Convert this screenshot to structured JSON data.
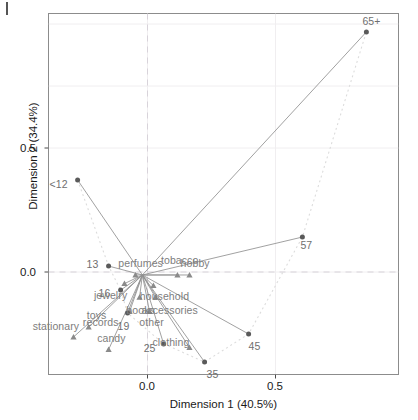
{
  "chart_data": {
    "type": "scatter",
    "title": "",
    "subtitle": "",
    "xlabel": "Dimension 1 (40.5%)",
    "ylabel": "Dimension 2 (34.4%)",
    "xlim": [
      -0.385,
      0.985
    ],
    "ylim": [
      -0.415,
      1.045
    ],
    "xticks": [
      0.0,
      0.5
    ],
    "xtick_labels": [
      "0.0",
      "0.5"
    ],
    "yticks": [
      0.0,
      0.5
    ],
    "ytick_labels": [
      "0.0",
      "0.5"
    ],
    "grid": "faint major + minor gridlines, dashed reference lines at x=0 and y=0",
    "legend": "none",
    "series": [
      {
        "name": "age-groups",
        "marker": "circle",
        "color": "#5a5a5a",
        "points": [
          {
            "label": "65+",
            "x": 0.855,
            "y": 0.968
          },
          {
            "label": "57",
            "x": 0.605,
            "y": 0.141
          },
          {
            "label": "<12",
            "x": -0.273,
            "y": 0.371
          },
          {
            "label": "13",
            "x": -0.152,
            "y": 0.024
          },
          {
            "label": "16",
            "x": -0.105,
            "y": -0.073
          },
          {
            "label": "19",
            "x": -0.078,
            "y": -0.165
          },
          {
            "label": "25",
            "x": 0.063,
            "y": -0.29
          },
          {
            "label": "35",
            "x": 0.223,
            "y": -0.363
          },
          {
            "label": "45",
            "x": 0.395,
            "y": -0.25
          }
        ]
      },
      {
        "name": "product-categories",
        "marker": "triangle",
        "color": "#8a8a8a",
        "points": [
          {
            "label": "toys",
            "x": -0.23,
            "y": -0.222,
            "lx": -0.196,
            "ly": -0.178
          },
          {
            "label": "stationary",
            "x": -0.289,
            "y": -0.262,
            "lx": -0.345,
            "ly": -0.222
          },
          {
            "label": "candy",
            "x": -0.152,
            "y": -0.313,
            "lx": -0.145,
            "ly": -0.27
          },
          {
            "label": "perfumes",
            "x": -0.047,
            "y": -0.012,
            "lx": -0.031,
            "ly": 0.032
          },
          {
            "label": "tobacco",
            "x": 0.117,
            "y": -0.012,
            "lx": 0.125,
            "ly": 0.044
          },
          {
            "label": "hobby",
            "x": 0.164,
            "y": -0.012,
            "lx": 0.181,
            "ly": 0.032
          },
          {
            "label": "jewelry",
            "x": -0.09,
            "y": -0.047,
            "lx": -0.137,
            "ly": -0.098
          },
          {
            "label": "household",
            "x": 0.023,
            "y": -0.055,
            "lx": 0.063,
            "ly": -0.102
          },
          {
            "label": "books",
            "x": -0.031,
            "y": -0.102,
            "lx": -0.031,
            "ly": -0.156
          },
          {
            "label": "accessories",
            "x": 0.031,
            "y": -0.102,
            "lx": 0.09,
            "ly": -0.156
          },
          {
            "label": "records",
            "x": -0.07,
            "y": -0.16,
            "lx": -0.18,
            "ly": -0.207
          },
          {
            "label": "other",
            "x": 0.008,
            "y": -0.16,
            "lx": 0.02,
            "ly": -0.207
          },
          {
            "label": "clothing",
            "x": 0.164,
            "y": -0.305,
            "lx": 0.102,
            "ly": -0.286
          }
        ]
      }
    ],
    "annotations": {
      "origin_star": "all category triangles connected by grey segments radiating from the point near (-0.02, -0.012)",
      "trajectory": "dotted light-grey path connecting age groups <12, 13, 16, 19, 25, 35, 45, 57, 65+"
    }
  },
  "axes": {
    "x_label": "Dimension 1 (40.5%)",
    "y_label": "Dimension 2 (34.4%)",
    "x_tick_0": "0.0",
    "x_tick_1": "0.5",
    "y_tick_0": "0.0",
    "y_tick_1": "0.5"
  },
  "colors": {
    "point_circle": "#5a5a5a",
    "point_triangle": "#8a8a8a",
    "label_text": "#7d7d7d",
    "axis_text": "#1a1a1a",
    "frame": "#8c8c8c",
    "gridline": "#f0eef0",
    "refline": "#d8d3da",
    "connector": "#909090",
    "trajectory": "#dcdcdc"
  }
}
